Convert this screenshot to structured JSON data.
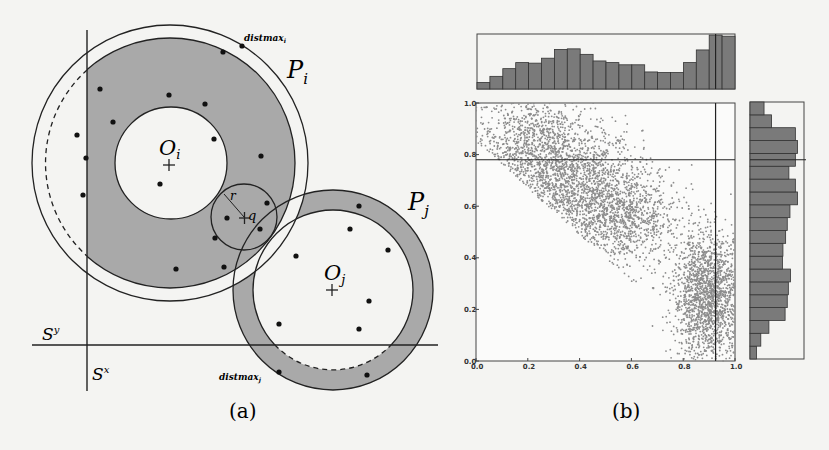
{
  "figure": {
    "panel_a": {
      "caption": "(a)",
      "labels": {
        "Pi": "P",
        "Pi_sub": "i",
        "Pj": "P",
        "Pj_sub": "j",
        "Oi": "O",
        "Oi_sub": "i",
        "Oj": "O",
        "Oj_sub": "j",
        "Sx": "S",
        "Sx_sup": "x",
        "Sy": "S",
        "Sy_sup": "y",
        "q": "q",
        "r": "r",
        "distmax_i": "distmax",
        "distmax_i_sub": "i",
        "distmax_j": "distmax",
        "distmax_j_sub": "j"
      },
      "colors": {
        "shade": "#a9a9a9",
        "line": "#222222",
        "background": "#f4f4f2"
      },
      "points": [
        [
          223,
          52
        ],
        [
          242,
          46
        ],
        [
          100,
          89
        ],
        [
          169,
          95
        ],
        [
          205,
          104
        ],
        [
          113,
          122
        ],
        [
          77,
          135
        ],
        [
          214,
          139
        ],
        [
          261,
          156
        ],
        [
          86,
          158
        ],
        [
          160,
          184
        ],
        [
          83,
          195
        ],
        [
          267,
          203
        ],
        [
          227,
          218
        ],
        [
          260,
          229
        ],
        [
          215,
          238
        ],
        [
          176,
          269
        ],
        [
          224,
          267
        ],
        [
          359,
          206
        ],
        [
          350,
          229
        ],
        [
          388,
          250
        ],
        [
          296,
          256
        ],
        [
          369,
          301
        ],
        [
          279,
          324
        ],
        [
          359,
          329
        ],
        [
          279,
          372
        ],
        [
          367,
          375
        ]
      ]
    },
    "panel_b": {
      "caption": "(b)"
    }
  },
  "chart_data": {
    "type": "scatter",
    "title": "",
    "xlabel": "",
    "ylabel": "",
    "xlim": [
      0.0,
      1.0
    ],
    "ylim": [
      0.0,
      1.0
    ],
    "x_ticks": [
      "0.0",
      "0.2",
      "0.4",
      "0.6",
      "0.8",
      "1.0"
    ],
    "y_ticks": [
      "0.0",
      "0.2",
      "0.4",
      "0.6",
      "0.8",
      "1.0"
    ],
    "grid": false,
    "marker_color": "#8c8c8c",
    "reference_lines": {
      "vertical_x": 0.925,
      "horizontal_y": 0.78
    },
    "clusters": [
      {
        "name": "upper-left cluster",
        "center": [
          0.3,
          0.75
        ],
        "spread": [
          0.17,
          0.13
        ],
        "n": 2600
      },
      {
        "name": "middle band",
        "center": [
          0.55,
          0.55
        ],
        "spread": [
          0.12,
          0.1
        ],
        "n": 1000
      },
      {
        "name": "lower-right cluster",
        "center": [
          0.9,
          0.25
        ],
        "spread": [
          0.07,
          0.12
        ],
        "n": 1800
      }
    ],
    "top_histogram": {
      "bins": 20,
      "relative_heights": [
        0.12,
        0.23,
        0.37,
        0.48,
        0.47,
        0.56,
        0.72,
        0.73,
        0.63,
        0.51,
        0.48,
        0.44,
        0.44,
        0.31,
        0.3,
        0.3,
        0.48,
        0.71,
        0.98,
        0.96
      ]
    },
    "right_histogram": {
      "bins": 20,
      "bins_order": "bottom_to_top",
      "relative_heights": [
        0.12,
        0.2,
        0.35,
        0.65,
        0.69,
        0.71,
        0.75,
        0.6,
        0.61,
        0.66,
        0.69,
        0.74,
        0.88,
        0.84,
        0.72,
        0.84,
        0.88,
        0.84,
        0.4,
        0.26
      ]
    }
  }
}
